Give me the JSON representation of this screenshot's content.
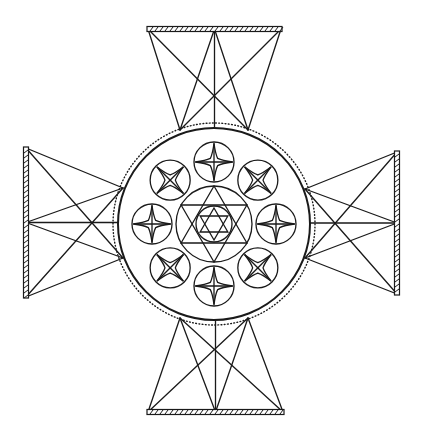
{
  "figure": {
    "title": "",
    "colors": {
      "ink": "#1a1a1a",
      "background": "#ffffff"
    }
  },
  "geometry": {
    "center": [
      214,
      224
    ],
    "main_circle_radius": 96,
    "dotted_ring_radius": 101,
    "small_circle_orbit": 62,
    "small_circle_radius": 20,
    "small_circle_count": 8,
    "hexagram_outer_circle_radius": 38,
    "hexagram_inner_circle_radius": 18,
    "arms": [
      {
        "name": "top",
        "bar": [
          148,
          29,
          281,
          29
        ],
        "anchors": [
          [
            180,
            130
          ],
          [
            248,
            130
          ]
        ]
      },
      {
        "name": "bottom",
        "bar": [
          148,
          412,
          283,
          412
        ],
        "anchors": [
          [
            180,
            318
          ],
          [
            248,
            318
          ]
        ]
      },
      {
        "name": "left",
        "bar": [
          26,
          148,
          26,
          297
        ],
        "anchors": [
          [
            123,
            188
          ],
          [
            123,
            258
          ]
        ]
      },
      {
        "name": "right",
        "bar": [
          397,
          152,
          397,
          294
        ],
        "anchors": [
          [
            305,
            189
          ],
          [
            305,
            258
          ]
        ]
      }
    ]
  }
}
